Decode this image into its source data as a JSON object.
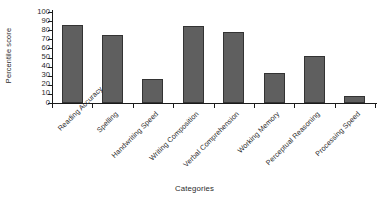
{
  "chart_data": {
    "type": "bar",
    "title": "",
    "categories": [
      "Reading Accuracy",
      "Spelling",
      "Handwriting Speed",
      "Writing Composition",
      "Verbal Comprehension",
      "Working Memory",
      "Perceptual Reasoning",
      "Processing Speed"
    ],
    "values": [
      86,
      75,
      26,
      85,
      78,
      33,
      52,
      8
    ],
    "xlabel": "Categories",
    "ylabel": "Percentile score",
    "ylim": [
      0,
      100
    ],
    "ytick_values": [
      0,
      10,
      20,
      30,
      40,
      50,
      60,
      70,
      80,
      90,
      100
    ],
    "ytick_labels": [
      "0",
      "10",
      "20",
      "30",
      "40",
      "50",
      "60",
      "70",
      "80",
      "90",
      "100"
    ],
    "grid": false,
    "legend": false,
    "bar_color": "#5f5f5f",
    "bar_edge_color": "#333333",
    "axis_color": "#1a1a1a",
    "background_color": "#ffffff",
    "xtick_label_rotation": 45
  }
}
